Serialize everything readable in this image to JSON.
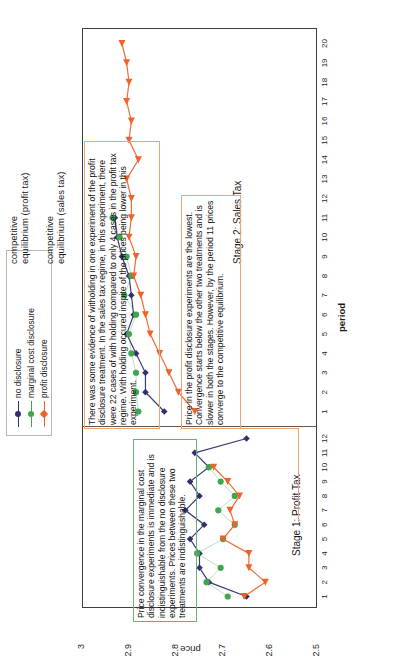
{
  "chart_data": {
    "type": "line",
    "title": "",
    "xlabel": "period",
    "ylabel": "price",
    "ylim": [
      2.5,
      3.0
    ],
    "yticks": [
      "2.5",
      "2.6",
      "2.7",
      "2.8",
      "2.9",
      "3"
    ],
    "grid": true,
    "legend_position": "top-center",
    "stages": [
      {
        "name": "Stage 1: Profit Tax",
        "periods": [
          1,
          2,
          3,
          4,
          5,
          6,
          7,
          8,
          9,
          10,
          11,
          12
        ],
        "competitive_equilibrium": 2.7,
        "series": [
          {
            "name": "no disclosure",
            "color": "#31316e",
            "values": [
              2.65,
              2.73,
              2.75,
              2.75,
              2.77,
              2.74,
              2.78,
              2.75,
              2.77,
              2.73,
              2.76,
              2.65
            ]
          },
          {
            "name": "marginal cost disclosure",
            "color": "#3fa64b",
            "values": [
              2.69,
              2.735,
              2.705,
              2.755,
              2.7,
              2.675,
              2.71,
              2.675,
              2.705,
              2.73,
              null,
              null
            ]
          },
          {
            "name": "profit disclosure",
            "color": "#f0622a",
            "values": [
              2.655,
              2.61,
              2.645,
              2.645,
              2.7,
              2.675,
              2.685,
              2.665,
              2.69,
              2.72,
              null,
              null
            ]
          }
        ]
      },
      {
        "name": "Stage 2: Sales Tax",
        "periods": [
          1,
          2,
          3,
          4,
          5,
          6,
          7,
          8,
          9,
          10,
          11,
          12,
          13,
          14,
          15,
          16,
          17,
          18,
          19,
          20
        ],
        "competitive_equilibrium": 2.9,
        "series": [
          {
            "name": "no disclosure",
            "color": "#31316e",
            "values": [
              2.825,
              2.865,
              2.865,
              2.885,
              2.905,
              2.89,
              2.895,
              2.9,
              2.915,
              2.925,
              2.93,
              null,
              null,
              null,
              null,
              null,
              null,
              null,
              null,
              null
            ]
          },
          {
            "name": "marginal cost disclosure",
            "color": "#3fa64b",
            "values": [
              2.88,
              2.885,
              2.885,
              2.895,
              2.9,
              2.885,
              2.91,
              2.895,
              2.905,
              2.92,
              2.935,
              null,
              null,
              null,
              null,
              null,
              null,
              null,
              null,
              null
            ]
          },
          {
            "name": "profit disclosure",
            "color": "#f0622a",
            "values": [
              2.76,
              2.795,
              2.815,
              2.835,
              2.855,
              2.865,
              2.875,
              2.89,
              2.885,
              2.9,
              2.895,
              2.895,
              2.905,
              2.88,
              2.9,
              2.895,
              2.905,
              2.9,
              2.905,
              2.915
            ]
          }
        ]
      }
    ]
  },
  "legend": {
    "items": [
      {
        "label": "no disclosure",
        "color": "#31316e"
      },
      {
        "label": "marginal cost disclosure",
        "color": "#3fa64b"
      },
      {
        "label": "profit disclosure",
        "color": "#f0622a"
      }
    ]
  },
  "axes": {
    "y_title": "price",
    "x_title": "period",
    "y_ticks": [
      "3",
      "2.9",
      "2.8",
      "2.7",
      "2.6",
      "2.5"
    ],
    "stage1_x_ticks": [
      "1",
      "2",
      "3",
      "4",
      "5",
      "6",
      "7",
      "8",
      "9",
      "10",
      "11",
      "12"
    ],
    "stage2_x_ticks": [
      "1",
      "2",
      "3",
      "4",
      "5",
      "6",
      "7",
      "8",
      "9",
      "10",
      "11",
      "12",
      "13",
      "14",
      "15",
      "16",
      "17",
      "18",
      "19",
      "20"
    ]
  },
  "stage_captions": {
    "stage1": "Stage 1: Profit Tax",
    "stage2": "Stage 2: Sales Tax"
  },
  "equilibrium_notes": {
    "sales_tax": "competitive\nequilibrium (sales tax)",
    "sales_tax_line1": "competitive",
    "sales_tax_line2": "equilibrium (sales tax)",
    "profit_tax_line1": "competitive",
    "profit_tax_line2": "equilibrium (profit tax)"
  },
  "callouts": {
    "green": "Price convergence in the marginal cost disclosure experiments is immediate and is indistinguishable from the no disclosure experiments. Prices between these two treatments are indistinguishable.",
    "orange_top": "There was some evidence of witholding in one experiment of the profit disclosure treatment. In the sales tax regime, in this experiment, there were 22 cases of with holding compared to only 4 cases in the profit tax regime. With holding occured inspite of the prices being lower in this experiment.",
    "orange_bottom": "Price in the profit disclosure experiments are the lowest. Convergence starts below the other two treatments and is slower in both the stages. However, by the period 11 prices converge to the competitive equilibrium."
  },
  "colors": {
    "no_disclosure": "#31316e",
    "marginal_cost_disclosure": "#3fa64b",
    "profit_disclosure": "#f0622a",
    "grid": "#c9c9c9",
    "equilibrium_line": "#9fb8cf",
    "frame": "#3f3f3f",
    "callout_green_border": "#6fae74",
    "callout_orange_border": "#e8a678"
  }
}
